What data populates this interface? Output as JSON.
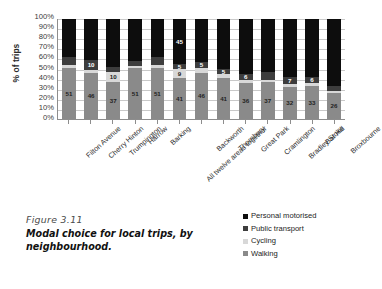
{
  "figure": {
    "number_label": "Figure 3.11",
    "title": "Modal choice for local trips, by neighbourhood."
  },
  "legend": {
    "position": "bottom-right",
    "items": [
      {
        "label": "Personal motorised",
        "color": "#0d0d0d"
      },
      {
        "label": "Public transport",
        "color": "#3d3d3d"
      },
      {
        "label": "Cycling",
        "color": "#d8d8d8"
      },
      {
        "label": "Walking",
        "color": "#8a8a8a"
      }
    ]
  },
  "chart_data": {
    "type": "bar",
    "stacked": true,
    "stack_mode": "percent",
    "title": "Modal choice for local trips, by neighbourhood.",
    "xlabel": "",
    "ylabel": "% of trips",
    "ylim": [
      0,
      100
    ],
    "yticks": [
      "100%",
      "90%",
      "80%",
      "70%",
      "60%",
      "50%",
      "40%",
      "30%",
      "20%",
      "10%",
      "0%"
    ],
    "grid": true,
    "categories": [
      "Filton Avenue",
      "Cherry Hinton",
      "Trumpington",
      "Harrow",
      "Barking",
      "All twelve areas together",
      "Backworth",
      "Thornbury",
      "Great Park",
      "Cramlington",
      "Bradley Stoke",
      "Bar Hill",
      "Broxbourne"
    ],
    "series": [
      {
        "name": "Walking",
        "color": "#8a8a8a",
        "values": [
          51,
          46,
          37,
          51,
          51,
          41,
          46,
          41,
          36,
          37,
          32,
          33,
          26
        ]
      },
      {
        "name": "Cycling",
        "color": "#d8d8d8",
        "values": [
          3,
          3,
          10,
          2,
          3,
          9,
          5,
          4,
          3,
          2,
          3,
          3,
          2
        ]
      },
      {
        "name": "Public transport",
        "color": "#3d3d3d",
        "values": [
          8,
          10,
          5,
          5,
          8,
          5,
          6,
          5,
          6,
          8,
          7,
          6,
          5
        ]
      },
      {
        "name": "Personal motorised",
        "color": "#0d0d0d",
        "values": [
          38,
          41,
          48,
          42,
          38,
          45,
          43,
          50,
          55,
          53,
          58,
          58,
          67
        ]
      }
    ],
    "bar_labels": {
      "walking": [
        51,
        46,
        37,
        51,
        51,
        41,
        46,
        41,
        36,
        37,
        32,
        33,
        26
      ],
      "cycling": [
        null,
        null,
        10,
        null,
        null,
        9,
        null,
        null,
        null,
        null,
        null,
        null,
        null
      ],
      "public_transport": [
        null,
        10,
        null,
        null,
        null,
        5,
        5,
        5,
        6,
        null,
        7,
        6,
        null
      ],
      "personal_motorised": [
        null,
        null,
        null,
        null,
        null,
        45,
        null,
        null,
        null,
        null,
        null,
        null,
        null
      ]
    }
  }
}
